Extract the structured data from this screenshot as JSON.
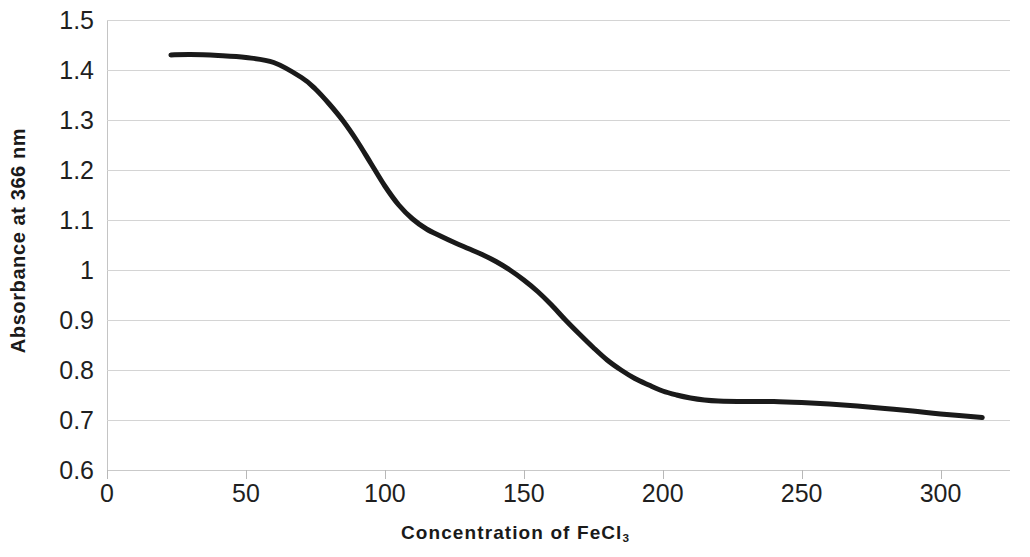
{
  "chart_data": {
    "type": "line",
    "title": "",
    "xlabel": "Concentration of FeCl",
    "xlabel_subscript": "3",
    "ylabel": "Absorbance at 366 nm",
    "xlim": [
      0,
      325
    ],
    "ylim": [
      0.6,
      1.5
    ],
    "xticks": [
      0,
      50,
      100,
      150,
      200,
      250,
      300
    ],
    "xtick_labels": [
      "0",
      "50",
      "100",
      "150",
      "200",
      "250",
      "300"
    ],
    "yticks": [
      0.6,
      0.7,
      0.8,
      0.9,
      1.0,
      1.1,
      1.2,
      1.3,
      1.4,
      1.5
    ],
    "ytick_labels": [
      "0.6",
      "0.7",
      "0.8",
      "0.9",
      "1",
      "1.1",
      "1.2",
      "1.3",
      "1.4",
      "1.5"
    ],
    "grid": "horizontal",
    "legend": "none",
    "series": [
      {
        "name": "Absorbance",
        "color": "#1a1a1a",
        "line_width": 5,
        "x": [
          23,
          30,
          40,
          50,
          60,
          70,
          75,
          80,
          85,
          90,
          95,
          100,
          105,
          110,
          115,
          120,
          125,
          130,
          135,
          140,
          145,
          150,
          155,
          160,
          165,
          170,
          175,
          180,
          185,
          190,
          195,
          200,
          205,
          210,
          215,
          220,
          230,
          240,
          250,
          260,
          270,
          280,
          290,
          300,
          315
        ],
        "y": [
          1.43,
          1.431,
          1.429,
          1.425,
          1.415,
          1.385,
          1.362,
          1.332,
          1.298,
          1.258,
          1.213,
          1.168,
          1.13,
          1.102,
          1.082,
          1.068,
          1.055,
          1.043,
          1.031,
          1.017,
          1.0,
          0.98,
          0.957,
          0.93,
          0.9,
          0.872,
          0.845,
          0.82,
          0.8,
          0.783,
          0.77,
          0.758,
          0.75,
          0.744,
          0.74,
          0.738,
          0.737,
          0.737,
          0.735,
          0.732,
          0.728,
          0.723,
          0.718,
          0.712,
          0.705
        ]
      }
    ]
  }
}
